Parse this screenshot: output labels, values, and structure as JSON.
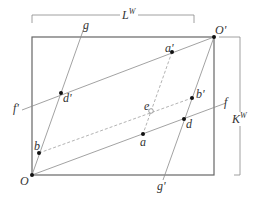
{
  "diagram": {
    "labels": {
      "width_label": "L",
      "width_sup": "W",
      "height_label": "K",
      "height_sup": "W",
      "origin": "O",
      "origin_prime": "O'",
      "line_f": "f",
      "line_f_prime": "f'",
      "line_g": "g",
      "line_g_prime": "g'",
      "point_a": "a",
      "point_a_prime": "a'",
      "point_b": "b",
      "point_b_prime": "b'",
      "point_d": "d",
      "point_d_prime": "d'",
      "point_e": "e"
    },
    "colors": {
      "frame": "#666666",
      "line": "#8a8a8a",
      "dashed": "#a0a0a0",
      "point": "#111111"
    }
  }
}
